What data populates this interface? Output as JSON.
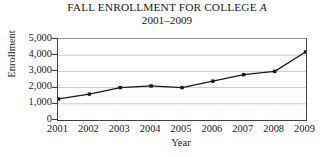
{
  "chart_data": {
    "type": "line",
    "title": "FALL ENROLLMENT FOR COLLEGE A",
    "title_plain": "FALL ENROLLMENT FOR COLLEGE ",
    "title_italic": "A",
    "subtitle": "2001–2009",
    "xlabel": "Year",
    "ylabel": "Enrollment",
    "categories": [
      "2001",
      "2002",
      "2003",
      "2004",
      "2005",
      "2006",
      "2007",
      "2008",
      "2009"
    ],
    "x": [
      2001,
      2002,
      2003,
      2004,
      2005,
      2006,
      2007,
      2008,
      2009
    ],
    "values": [
      1300,
      1600,
      2000,
      2100,
      2000,
      2400,
      2800,
      3000,
      4200
    ],
    "series": [
      {
        "name": "Enrollment",
        "values": [
          1300,
          1600,
          2000,
          2100,
          2000,
          2400,
          2800,
          3000,
          4200
        ]
      }
    ],
    "ylim": [
      0,
      5000
    ],
    "ytick_values": [
      0,
      1000,
      2000,
      3000,
      4000,
      5000
    ],
    "ytick_labels": [
      "0",
      "1,000",
      "2,000",
      "3,000",
      "4,000",
      "5,000"
    ],
    "xlim": [
      2001,
      2009
    ],
    "grid": "horizontal",
    "grid_color": "#c9c9c9",
    "line_color": "#1a1a1a",
    "marker": "square",
    "marker_color": "#1a1a1a",
    "legend": "none",
    "background": "#ffffff"
  }
}
